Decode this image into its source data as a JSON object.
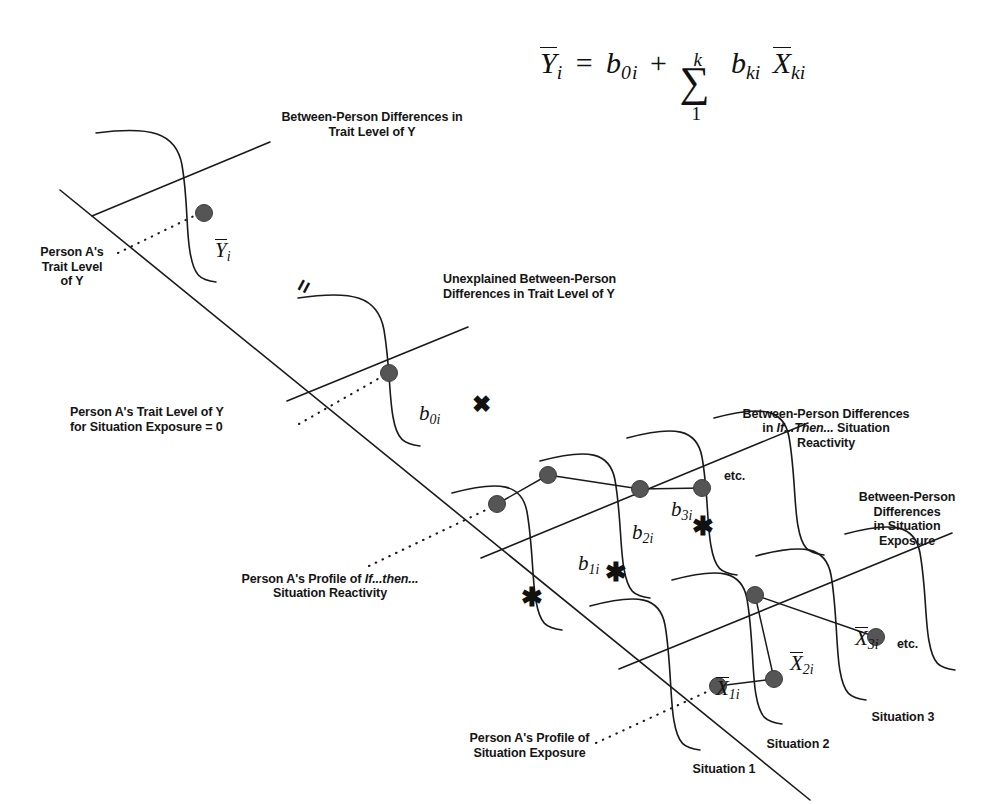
{
  "figure": {
    "type": "conceptual-diagram",
    "equation": {
      "lhs": "Ȳᵢ",
      "equals": "=",
      "term_intercept": "b₀ᵢ",
      "plus": "+",
      "sum_upper": "k",
      "sum_lower": "1",
      "sum_symbol": "∑",
      "term_slope": "bₖᵢ",
      "term_predictor": "X̄ₖᵢ",
      "full": "Ȳi = b0i + Σ(1..k) bki X̄ki"
    },
    "labels": {
      "trait_level_header": "Between-Person Differences in\nTrait Level of Y",
      "person_a_trait": "Person A's\nTrait Level\nof Y",
      "unexplained": "Unexplained Between-Person\nDifferences in Trait Level of Y",
      "person_a_trait_zero": "Person A's Trait Level of Y\nfor Situation Exposure = 0",
      "reactivity_header_pre": "Between-Person Differences\nin ",
      "reactivity_header_ital": "If...Then...",
      "reactivity_header_post": " Situation\nReactivity",
      "exposure_header": "Between-Person\nDifferences\nin Situation\nExposure",
      "person_a_reactivity_pre": "Person A's Profile of ",
      "person_a_reactivity_ital": "If...then...",
      "person_a_reactivity_post": "\nSituation Reactivity",
      "person_a_exposure": "Person A's Profile of\nSituation Exposure",
      "etc_upper": "etc.",
      "etc_lower": "etc.",
      "situation_1": "Situation 1",
      "situation_2": "Situation 2",
      "situation_3": "Situation 3"
    },
    "math_annotations": {
      "y_bar_i": {
        "base": "Y",
        "sub": "i",
        "overline": true
      },
      "b_0i": {
        "base": "b",
        "sub": "0i",
        "overline": false
      },
      "b_1i": {
        "base": "b",
        "sub": "1i",
        "overline": false
      },
      "b_2i": {
        "base": "b",
        "sub": "2i",
        "overline": false
      },
      "b_3i": {
        "base": "b",
        "sub": "3i",
        "overline": false
      },
      "x_bar_1i": {
        "base": "X",
        "sub": "1i",
        "overline": true
      },
      "x_bar_2i": {
        "base": "X",
        "sub": "2i",
        "overline": true
      },
      "x_bar_3i": {
        "base": "X",
        "sub": "3i",
        "overline": true
      }
    },
    "operators": {
      "equals_rotated": "=",
      "times_cross": "✖",
      "star_1": "✱",
      "star_2": "✱",
      "star_3": "✱"
    },
    "colors": {
      "background": "#ffffff",
      "stroke": "#1a1a1a",
      "dot_fill": "#555555",
      "dot_stroke": "#3a3a3a",
      "text": "#151515"
    },
    "data_points": {
      "trait_dot": [
        204,
        213
      ],
      "intercept_dot": [
        389,
        373
      ],
      "reactivity_profile": [
        [
          497,
          504
        ],
        [
          548,
          475
        ],
        [
          640,
          489
        ],
        [
          702,
          488
        ]
      ],
      "exposure_profile": [
        [
          718,
          686
        ],
        [
          774,
          679
        ],
        [
          755,
          595
        ],
        [
          876,
          637
        ]
      ]
    }
  }
}
